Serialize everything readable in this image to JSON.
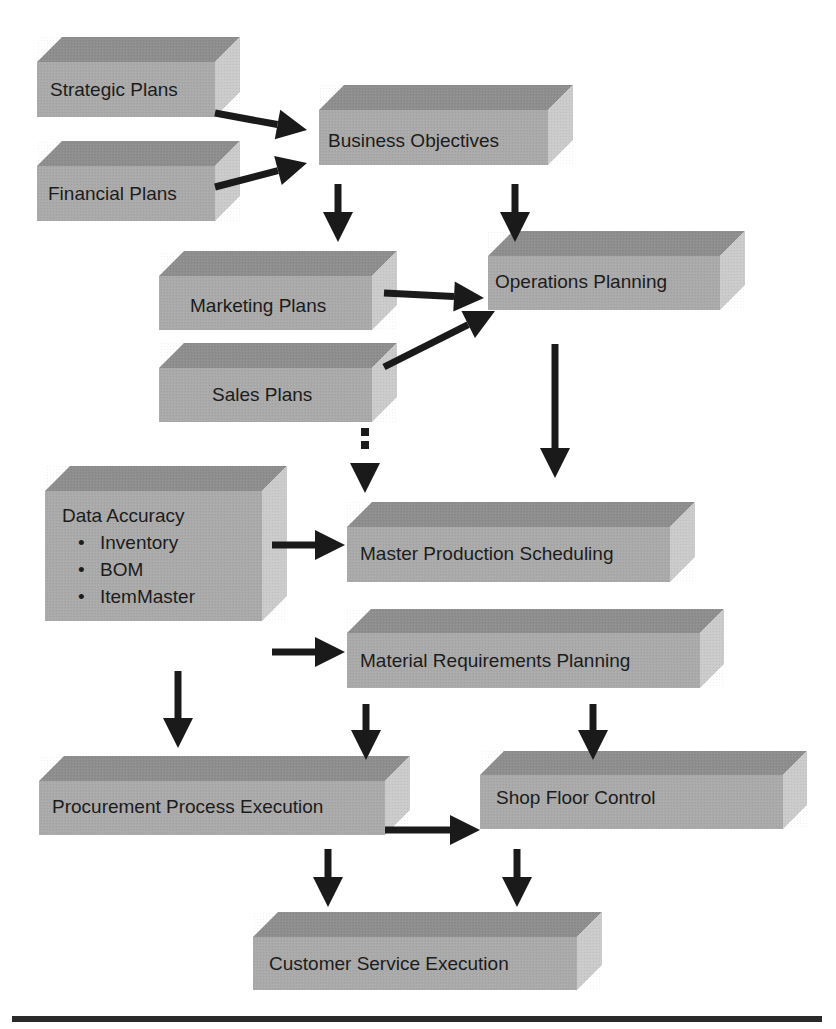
{
  "colors": {
    "top_face": "#8e8e8e",
    "front_face": "#aaaaaa",
    "side_face": "#cbcbcb",
    "arrow": "#1a1a1a",
    "rule": "#2a2a2a",
    "text": "#1c1c1c"
  },
  "boxes": [
    {
      "id": "strategic-plans",
      "label": "Strategic Plans",
      "x": 37,
      "y": 62,
      "w": 178,
      "h": 55,
      "d": 25,
      "tx": 50,
      "ty": 78
    },
    {
      "id": "financial-plans",
      "label": "Financial Plans",
      "x": 37,
      "y": 166,
      "w": 178,
      "h": 55,
      "d": 25,
      "tx": 48,
      "ty": 182
    },
    {
      "id": "business-objectives",
      "label": "Business Objectives",
      "x": 319,
      "y": 110,
      "w": 229,
      "h": 55,
      "d": 25,
      "tx": 328,
      "ty": 129
    },
    {
      "id": "marketing-plans",
      "label": "Marketing Plans",
      "x": 159,
      "y": 276,
      "w": 213,
      "h": 54,
      "d": 25,
      "tx": 190,
      "ty": 294
    },
    {
      "id": "operations-planning",
      "label": "Operations Planning",
      "x": 488,
      "y": 256,
      "w": 232,
      "h": 54,
      "d": 25,
      "tx": 495,
      "ty": 270
    },
    {
      "id": "sales-plans",
      "label": "Sales Plans",
      "x": 159,
      "y": 368,
      "w": 213,
      "h": 54,
      "d": 25,
      "tx": 212,
      "ty": 383
    },
    {
      "id": "data-accuracy",
      "label": "Data Accuracy",
      "items": [
        "Inventory",
        "BOM",
        "ItemMaster"
      ],
      "x": 45,
      "y": 491,
      "w": 217,
      "h": 130,
      "d": 25,
      "tx": 62,
      "ty": 502
    },
    {
      "id": "master-production-scheduling",
      "label": "Master Production Scheduling",
      "x": 347,
      "y": 527,
      "w": 323,
      "h": 55,
      "d": 25,
      "tx": 360,
      "ty": 542
    },
    {
      "id": "material-requirements-planning",
      "label": "Material Requirements Planning",
      "x": 347,
      "y": 633,
      "w": 353,
      "h": 55,
      "d": 24,
      "tx": 360,
      "ty": 649
    },
    {
      "id": "procurement-process-execution",
      "label": "Procurement Process Execution",
      "x": 39,
      "y": 781,
      "w": 346,
      "h": 54,
      "d": 25,
      "tx": 52,
      "ty": 795
    },
    {
      "id": "shop-floor-control",
      "label": "Shop Floor Control",
      "x": 480,
      "y": 775,
      "w": 303,
      "h": 54,
      "d": 24,
      "tx": 496,
      "ty": 786
    },
    {
      "id": "customer-service-execution",
      "label": "Customer Service Execution",
      "x": 253,
      "y": 937,
      "w": 324,
      "h": 53,
      "d": 25,
      "tx": 269,
      "ty": 952
    }
  ],
  "arrows": [
    {
      "id": "strategic-to-business",
      "from": [
        215,
        113
      ],
      "to": [
        307,
        130
      ],
      "dashed": false
    },
    {
      "id": "financial-to-business",
      "from": [
        215,
        187
      ],
      "to": [
        307,
        163
      ],
      "dashed": false
    },
    {
      "id": "business-to-marketing",
      "from": [
        338,
        184
      ],
      "to": [
        338,
        242
      ],
      "dashed": false
    },
    {
      "id": "business-to-operations",
      "from": [
        515,
        184
      ],
      "to": [
        515,
        242
      ],
      "dashed": false
    },
    {
      "id": "marketing-to-operations",
      "from": [
        384,
        293
      ],
      "to": [
        484,
        298
      ],
      "dashed": false
    },
    {
      "id": "sales-to-operations",
      "from": [
        384,
        367
      ],
      "to": [
        495,
        311
      ],
      "dashed": false
    },
    {
      "id": "operations-to-mps",
      "from": [
        555,
        344
      ],
      "to": [
        555,
        478
      ],
      "dashed": false
    },
    {
      "id": "sales-to-mps-dotted",
      "from": [
        365,
        432
      ],
      "to": [
        365,
        493
      ],
      "dashed": true
    },
    {
      "id": "data-accuracy-to-mps",
      "from": [
        272,
        545
      ],
      "to": [
        345,
        545
      ],
      "dashed": false
    },
    {
      "id": "data-accuracy-to-mrp",
      "from": [
        272,
        652
      ],
      "to": [
        345,
        652
      ],
      "dashed": false
    },
    {
      "id": "data-to-procurement",
      "from": [
        178,
        671
      ],
      "to": [
        178,
        748
      ],
      "dashed": false
    },
    {
      "id": "mrp-to-procurement",
      "from": [
        366,
        704
      ],
      "to": [
        366,
        760
      ],
      "dashed": false
    },
    {
      "id": "mrp-to-shop-floor",
      "from": [
        593,
        704
      ],
      "to": [
        593,
        760
      ],
      "dashed": false
    },
    {
      "id": "procurement-to-shop-floor",
      "from": [
        385,
        830
      ],
      "to": [
        480,
        830
      ],
      "dashed": false
    },
    {
      "id": "procurement-to-customer",
      "from": [
        328,
        849
      ],
      "to": [
        328,
        907
      ],
      "dashed": false
    },
    {
      "id": "shop-floor-to-customer",
      "from": [
        517,
        849
      ],
      "to": [
        517,
        907
      ],
      "dashed": false
    }
  ],
  "rule": {
    "x1": 12,
    "y": 1019,
    "x2": 822,
    "thickness": 6
  }
}
